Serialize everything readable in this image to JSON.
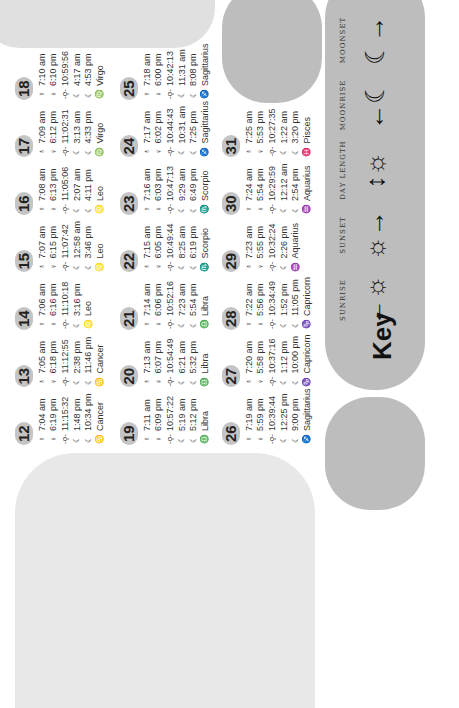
{
  "legend": {
    "title": "Key",
    "items": [
      {
        "label": "SUNRISE",
        "icon": "sunrise-icon",
        "glyph": "←☼"
      },
      {
        "label": "SUNSET",
        "icon": "sunset-icon",
        "glyph": "☼→"
      },
      {
        "label": "DAY LENGTH",
        "icon": "day-length-icon",
        "glyph": "↕☼"
      },
      {
        "label": "MOONRISE",
        "icon": "moonrise-icon",
        "glyph": "←☾"
      },
      {
        "label": "MOONSET",
        "icon": "moonset-icon",
        "glyph": "☾→"
      }
    ]
  },
  "row_icons": {
    "sunrise": "♁",
    "sunset": "♀",
    "daylength": "-ǫ-",
    "moon": "☾",
    "moonrise": "☾",
    "zodiac": ""
  },
  "days": [
    {
      "day": "12",
      "sunrise": "7:04 am",
      "sunset": "6:19 pm",
      "daylength": "11:15:32",
      "moon1": "1:48 pm",
      "moon2": "10:34 pm",
      "sign_symbol": "♋",
      "sign": "Cancer"
    },
    {
      "day": "13",
      "sunrise": "7:05 am",
      "sunset": "6:18 pm",
      "daylength": "11:12:55",
      "moon1": "2:38 pm",
      "moon2": "11:46 pm",
      "sign_symbol": "♋",
      "sign": "Cancer"
    },
    {
      "day": "14",
      "sunrise": "7:06 am",
      "sunset": "6:16 pm",
      "daylength": "11:10:18",
      "moon1": "3:16 pm",
      "moon2": "",
      "sign_symbol": "♌",
      "sign": "Leo"
    },
    {
      "day": "15",
      "sunrise": "7:07 am",
      "sunset": "6:15 pm",
      "daylength": "11:07:42",
      "moon1": "12:58 am",
      "moon2": "3:46 pm",
      "sign_symbol": "♌",
      "sign": "Leo"
    },
    {
      "day": "16",
      "sunrise": "7:08 am",
      "sunset": "6:13 pm",
      "daylength": "11:05:06",
      "moon1": "2:07 am",
      "moon2": "4:11 pm",
      "sign_symbol": "♌",
      "sign": "Leo"
    },
    {
      "day": "17",
      "sunrise": "7:09 am",
      "sunset": "6:12 pm",
      "daylength": "11:02:31",
      "moon1": "3:13 am",
      "moon2": "4:33 pm",
      "sign_symbol": "♍",
      "sign": "Virgo"
    },
    {
      "day": "18",
      "sunrise": "7:10 am",
      "sunset": "6:10 pm",
      "daylength": "10:59:56",
      "moon1": "4:17 am",
      "moon2": "4:53 pm",
      "sign_symbol": "♍",
      "sign": "Virgo"
    },
    {
      "day": "19",
      "sunrise": "7:11 am",
      "sunset": "6:09 pm",
      "daylength": "10:57:22",
      "moon1": "5:19 am",
      "moon2": "5:12 pm",
      "sign_symbol": "♎",
      "sign": "Libra"
    },
    {
      "day": "20",
      "sunrise": "7:13 am",
      "sunset": "6:07 pm",
      "daylength": "10:54:49",
      "moon1": "6:21 am",
      "moon2": "5:32 pm",
      "sign_symbol": "♎",
      "sign": "Libra"
    },
    {
      "day": "21",
      "sunrise": "7:14 am",
      "sunset": "6:06 pm",
      "daylength": "10:52:16",
      "moon1": "7:23 am",
      "moon2": "5:54 pm",
      "sign_symbol": "♎",
      "sign": "Libra"
    },
    {
      "day": "22",
      "sunrise": "7:15 am",
      "sunset": "6:05 pm",
      "daylength": "10:49:44",
      "moon1": "8:25 am",
      "moon2": "6:19 pm",
      "sign_symbol": "♏",
      "sign": "Scorpio"
    },
    {
      "day": "23",
      "sunrise": "7:16 am",
      "sunset": "6:03 pm",
      "daylength": "10:47:13",
      "moon1": "9:29 am",
      "moon2": "6:49 pm",
      "sign_symbol": "♏",
      "sign": "Scorpio"
    },
    {
      "day": "24",
      "sunrise": "7:17 am",
      "sunset": "6:02 pm",
      "daylength": "10:44:43",
      "moon1": "10:31 am",
      "moon2": "7:25 pm",
      "sign_symbol": "♐",
      "sign": "Sagittarius"
    },
    {
      "day": "25",
      "sunrise": "7:18 am",
      "sunset": "6:00 pm",
      "daylength": "10:42:13",
      "moon1": "11:31 am",
      "moon2": "8:08 pm",
      "sign_symbol": "♐",
      "sign": "Sagittarius"
    },
    {
      "day": "26",
      "sunrise": "7:19 am",
      "sunset": "5:59 pm",
      "daylength": "10:39:44",
      "moon1": "12:25 pm",
      "moon2": "9:00 pm",
      "sign_symbol": "♐",
      "sign": "Sagittarius"
    },
    {
      "day": "27",
      "sunrise": "7:20 am",
      "sunset": "5:58 pm",
      "daylength": "10:37:16",
      "moon1": "1:12 pm",
      "moon2": "10:00 pm",
      "sign_symbol": "♑",
      "sign": "Capricorn"
    },
    {
      "day": "28",
      "sunrise": "7:22 am",
      "sunset": "5:56 pm",
      "daylength": "10:34:49",
      "moon1": "1:52 pm",
      "moon2": "11:05 pm",
      "sign_symbol": "♑",
      "sign": "Capricorn"
    },
    {
      "day": "29",
      "sunrise": "7:23 am",
      "sunset": "5:55 pm",
      "daylength": "10:32:24",
      "moon1": "2:26 pm",
      "moon2": "",
      "sign_symbol": "♒",
      "sign": "Aquarius"
    },
    {
      "day": "30",
      "sunrise": "7:24 am",
      "sunset": "5:54 pm",
      "daylength": "10:29:59",
      "moon1": "12:12 am",
      "moon2": "2:54 pm",
      "sign_symbol": "♒",
      "sign": "Aquarius"
    },
    {
      "day": "31",
      "sunrise": "7:25 am",
      "sunset": "5:53 pm",
      "daylength": "10:27:35",
      "moon1": "1:22 am",
      "moon2": "3:20 pm",
      "sign_symbol": "♓",
      "sign": "Pisces"
    }
  ]
}
